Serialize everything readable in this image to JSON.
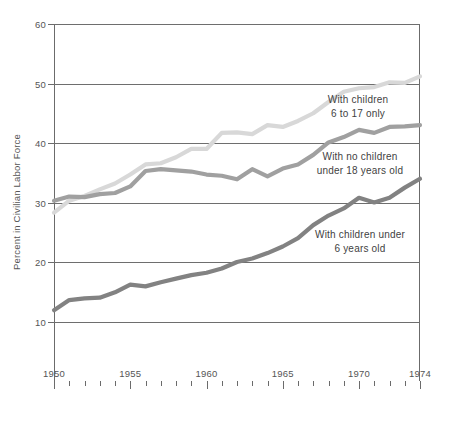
{
  "chart_data": {
    "type": "line",
    "title": "",
    "subtitle": "",
    "xlabel": "",
    "ylabel": "Percent in Civilian Labor Force",
    "xlim": [
      1950,
      1974
    ],
    "ylim": [
      0,
      60
    ],
    "yticks": [
      10,
      20,
      30,
      40,
      50,
      60
    ],
    "ytick_labels": [
      "10",
      "20",
      "30",
      "40",
      "50",
      "60"
    ],
    "xticks": [
      1950,
      1955,
      1960,
      1965,
      1970,
      1974
    ],
    "xtick_labels": [
      "1950",
      "1955",
      "1960",
      "1965",
      "1970",
      "1974"
    ],
    "x_minor_tick_interval": 1,
    "grid": "horizontal",
    "legend": "inline-annotations",
    "x": [
      1950,
      1951,
      1952,
      1953,
      1954,
      1955,
      1956,
      1957,
      1958,
      1959,
      1960,
      1961,
      1962,
      1963,
      1964,
      1965,
      1966,
      1967,
      1968,
      1969,
      1970,
      1971,
      1972,
      1973,
      1974
    ],
    "series": [
      {
        "name": "With children 6 to 17 only",
        "color": "#d8d8d8",
        "values": [
          28.3,
          30.3,
          31.1,
          32.2,
          33.2,
          34.7,
          36.4,
          36.6,
          37.6,
          39.0,
          39.0,
          41.7,
          41.8,
          41.5,
          43.0,
          42.7,
          43.7,
          45.0,
          46.9,
          48.6,
          49.2,
          49.4,
          50.2,
          50.1,
          51.2
        ]
      },
      {
        "name": "With no children under 18 years old",
        "color": "#a0a0a0",
        "values": [
          30.3,
          31.0,
          30.9,
          31.4,
          31.6,
          32.7,
          35.3,
          35.6,
          35.4,
          35.2,
          34.7,
          34.5,
          33.9,
          35.6,
          34.4,
          35.7,
          36.4,
          38.0,
          40.1,
          41.0,
          42.2,
          41.7,
          42.7,
          42.8,
          43.0
        ]
      },
      {
        "name": "With children under 6 years old",
        "color": "#828282",
        "values": [
          11.9,
          13.6,
          13.9,
          14.0,
          14.9,
          16.2,
          15.9,
          16.6,
          17.2,
          17.8,
          18.2,
          18.9,
          20.0,
          20.6,
          21.5,
          22.6,
          24.0,
          26.2,
          27.8,
          29.0,
          30.8,
          30.0,
          30.8,
          32.5,
          34.0
        ]
      }
    ],
    "annotations": [
      {
        "id": "annot-children-6-17",
        "line1": "With children",
        "line2": "6 to 17 only"
      },
      {
        "id": "annot-no-children",
        "line1": "With no children",
        "line2": "under 18 years old"
      },
      {
        "id": "annot-children-under-6",
        "line1": "With children under",
        "line2": "6 years old"
      }
    ]
  }
}
